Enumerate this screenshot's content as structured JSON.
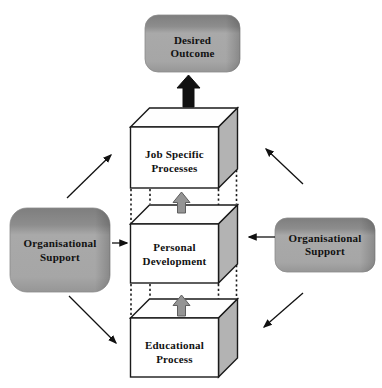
{
  "diagram": {
    "nodes": {
      "desired_outcome": {
        "lines": [
          "Desired",
          "Outcome"
        ]
      },
      "job_specific_processes": {
        "lines": [
          "Job Specific",
          "Processes"
        ]
      },
      "personal_development": {
        "lines": [
          "Personal",
          "Development"
        ]
      },
      "educational_process": {
        "lines": [
          "Educational",
          "Process"
        ]
      },
      "left_support": {
        "lines": [
          "Organisational",
          "Support"
        ]
      },
      "right_support": {
        "lines": [
          "Organisational",
          "Support"
        ]
      }
    },
    "edges": [
      {
        "from": "educational-process",
        "to": "personal-development",
        "style": "gray-block-arrow-up"
      },
      {
        "from": "personal-development",
        "to": "job-specific-processes",
        "style": "gray-block-arrow-up"
      },
      {
        "from": "job-specific-processes",
        "to": "desired-outcome",
        "style": "black-block-arrow-up"
      },
      {
        "from": "left-support",
        "to": "job-specific-processes",
        "style": "thin-arrow-diagonal-up-right"
      },
      {
        "from": "left-support",
        "to": "personal-development",
        "style": "thin-arrow-right"
      },
      {
        "from": "left-support",
        "to": "educational-process",
        "style": "thin-arrow-diagonal-down-right"
      },
      {
        "from": "right-support",
        "to": "job-specific-processes",
        "style": "thin-arrow-diagonal-up-left"
      },
      {
        "from": "right-support",
        "to": "personal-development",
        "style": "thin-arrow-left"
      },
      {
        "from": "right-support",
        "to": "educational-process",
        "style": "thin-arrow-diagonal-down-left"
      }
    ],
    "colors": {
      "background": "#ffffff",
      "slab_top": "#7e7e7e",
      "slab_mid": "#a9a9a9",
      "slab_bottom": "#969696",
      "box_face": "#ffffff",
      "box_side": "#b3b3b3",
      "box_outline": "#1a1a1a",
      "gray_block_arrow": "#949494",
      "black_block_arrow": "#111111",
      "thin_arrow": "#111111",
      "label_text": "#111111"
    }
  }
}
